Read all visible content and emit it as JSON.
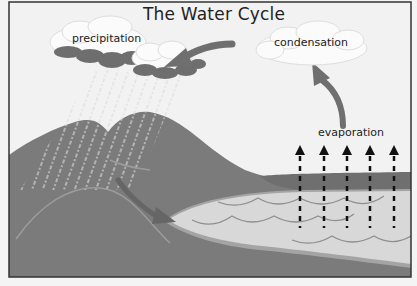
{
  "title": "The Water Cycle",
  "labels": {
    "precipitation": "precipitation",
    "condensation": "condensation",
    "evaporation": "evaporation"
  },
  "colors": {
    "sky": "#f2f2f2",
    "ground": "#7b7b7b",
    "ground_light": "#8a8a8a",
    "lake": "#d8d8d8",
    "lake_rim": "#9a9a9a",
    "cloud_white": "#fbfbfb",
    "cloud_dark": "#6e6e6e",
    "arrow": "#6f6f6f",
    "evap_arrow": "#111111",
    "frame": "#333333"
  },
  "diagram": {
    "stages": [
      "precipitation",
      "condensation",
      "evaporation",
      "runoff"
    ],
    "evaporation_arrow_count": 5
  }
}
